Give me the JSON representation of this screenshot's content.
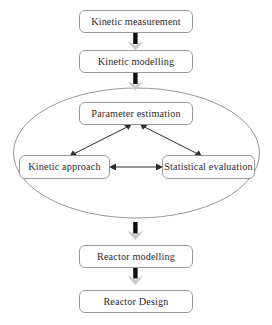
{
  "diagram": {
    "type": "flowchart",
    "background_color": "#ffffff",
    "box_stroke_color": "#8d8d8d",
    "text_color": "#2b2b2b",
    "thick_arrow_color": "#111111",
    "thick_arrowhead_color": "#c9c9c9",
    "thin_arrow_color": "#2e2e2e",
    "ellipse_stroke_color": "#8a8a8a",
    "nodes": [
      {
        "id": "kinetic-measurement",
        "label": "Kinetic measurement"
      },
      {
        "id": "kinetic-modelling",
        "label": "Kinetic modelling"
      },
      {
        "id": "parameter-estimation",
        "label": "Parameter estimation"
      },
      {
        "id": "kinetic-approach",
        "label": "Kinetic approach"
      },
      {
        "id": "statistical-evaluation",
        "label": "Statistical evaluation"
      },
      {
        "id": "reactor-modelling",
        "label": "Reactor modelling"
      },
      {
        "id": "reactor-design",
        "label": "Reactor Design"
      }
    ],
    "grouping": {
      "id": "estimation-loop",
      "shape": "ellipse",
      "contains": [
        "parameter-estimation",
        "kinetic-approach",
        "statistical-evaluation"
      ]
    },
    "connections": [
      {
        "id": "conn-measurement-modelling",
        "from": "kinetic-measurement",
        "to": "kinetic-modelling",
        "style": "thick",
        "heads": "single"
      },
      {
        "id": "conn-modelling-estimation",
        "from": "kinetic-modelling",
        "to": "parameter-estimation",
        "style": "thick",
        "heads": "single"
      },
      {
        "id": "conn-estimation-kinetic",
        "from": "parameter-estimation",
        "to": "kinetic-approach",
        "style": "thin",
        "heads": "double"
      },
      {
        "id": "conn-estimation-statistical",
        "from": "parameter-estimation",
        "to": "statistical-evaluation",
        "style": "thin",
        "heads": "double"
      },
      {
        "id": "conn-kinetic-statistical",
        "from": "kinetic-approach",
        "to": "statistical-evaluation",
        "style": "thin",
        "heads": "double"
      },
      {
        "id": "conn-loop-reactor-modelling",
        "from": "estimation-loop",
        "to": "reactor-modelling",
        "style": "thick",
        "heads": "single"
      },
      {
        "id": "conn-reactor-modelling-design",
        "from": "reactor-modelling",
        "to": "reactor-design",
        "style": "thick",
        "heads": "single"
      }
    ]
  }
}
